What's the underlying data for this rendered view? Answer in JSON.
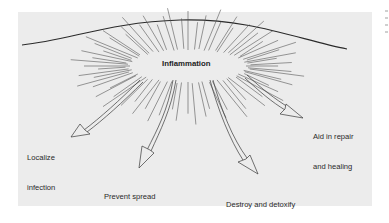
{
  "diagram": {
    "title": "Inflammation",
    "outcomes": [
      {
        "id": "localize",
        "line1": "Localize",
        "line2": "infection"
      },
      {
        "id": "prevent",
        "line1": "Prevent spread",
        "line2": "of pathogens"
      },
      {
        "id": "destroy",
        "line1": "Destroy and detoxify",
        "line2": "pathogens"
      },
      {
        "id": "repair",
        "line1": "Aid in repair",
        "line2": "and healing"
      }
    ],
    "colors": {
      "background": "#ececec",
      "ink": "#2a2a2a",
      "page": "#ffffff"
    }
  }
}
